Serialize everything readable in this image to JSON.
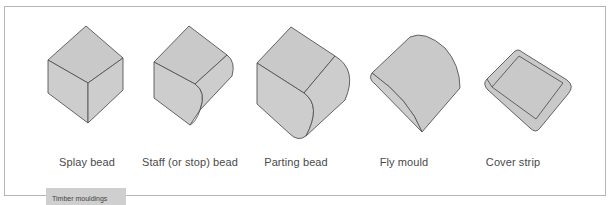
{
  "figure": {
    "caption": "Timber mouldings",
    "items": [
      {
        "name": "splay-bead",
        "label": "Splay bead"
      },
      {
        "name": "staff-bead",
        "label": "Staff (or stop) bead"
      },
      {
        "name": "parting-bead",
        "label": "Parting bead"
      },
      {
        "name": "fly-mould",
        "label": "Fly mould"
      },
      {
        "name": "cover-strip",
        "label": "Cover strip"
      }
    ]
  },
  "colors": {
    "fill": "#c9c9c9",
    "stroke": "#555555",
    "caption_bg": "#cfcfcf",
    "border": "#b5b5b5"
  }
}
